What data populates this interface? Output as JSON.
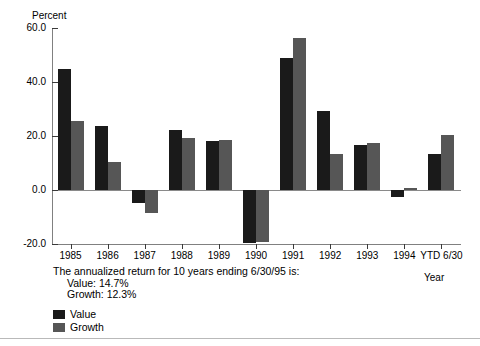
{
  "chart_data": {
    "type": "bar",
    "title": "",
    "xlabel": "Year",
    "ylabel": "Percent",
    "ylim": [
      -20.0,
      60.0
    ],
    "yticks": [
      "60.0",
      "40.0",
      "20.0",
      "0.0",
      "-20.0"
    ],
    "ytick_values": [
      60.0,
      40.0,
      20.0,
      0.0,
      -20.0
    ],
    "grid": false,
    "legend_position": "bottom-left",
    "categories": [
      "1985",
      "1986",
      "1987",
      "1988",
      "1989",
      "1990",
      "1991",
      "1992",
      "1993",
      "1994",
      "YTD 6/30"
    ],
    "series": [
      {
        "name": "Value",
        "color": "#1a1a1a",
        "values": [
          44.9,
          23.7,
          -4.8,
          22.1,
          18.0,
          -19.5,
          49.0,
          29.2,
          16.5,
          -2.5,
          13.2
        ]
      },
      {
        "name": "Growth",
        "color": "#565656",
        "values": [
          25.7,
          10.2,
          -8.5,
          19.3,
          18.6,
          -19.4,
          56.2,
          13.2,
          17.5,
          0.8,
          20.4
        ]
      }
    ],
    "annotations": [
      "The annualized return for 10 years ending 6/30/95 is:",
      "Value: 14.7%",
      "Growth: 12.3%"
    ]
  },
  "axis": {
    "y_title": "Percent",
    "x_title": "Year"
  },
  "legend": {
    "items": [
      {
        "label": "Value"
      },
      {
        "label": "Growth"
      }
    ]
  },
  "colors": {
    "value_series": "#1a1a1a",
    "growth_series": "#565656",
    "axis": "#808080",
    "background": "#ffffff"
  }
}
